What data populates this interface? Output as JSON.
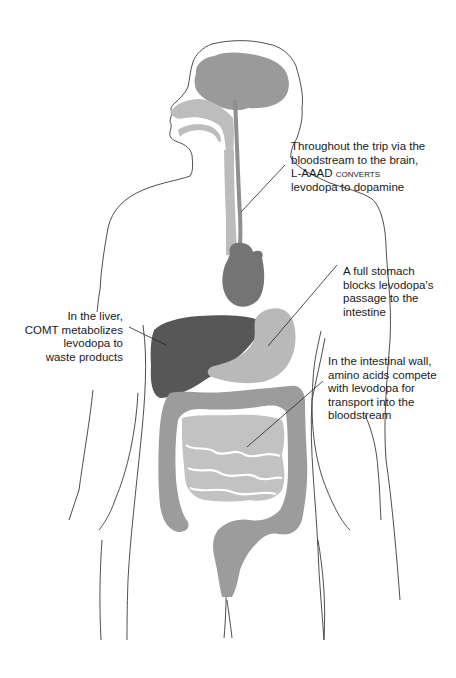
{
  "figure": {
    "colors": {
      "outline": "#3a3a3a",
      "brain": "#9a9a9a",
      "airway": "#bdbdbd",
      "vessel": "#8f8f8f",
      "esophagus": "#bcbcbc",
      "heart": "#747474",
      "liver": "#575757",
      "stomach": "#b9b9b9",
      "colon": "#9c9c9c",
      "small_intestine": "#c2c2c2",
      "leader": "#222222"
    }
  },
  "annotations": [
    {
      "id": "brain",
      "lines": [
        "Throughout the trip via the",
        "bloodstream to the brain,",
        "L-AAAD converts",
        "levodopa to dopamine"
      ]
    },
    {
      "id": "stomach",
      "lines": [
        "A full stomach",
        "blocks levodopa's",
        "passage to the",
        "intestine"
      ]
    },
    {
      "id": "liver",
      "lines": [
        "In the liver,",
        "COMT metabolizes",
        "levodopa to",
        "waste products"
      ]
    },
    {
      "id": "intestine",
      "lines": [
        "In the intestinal wall,",
        "amino acids compete",
        "with levodopa for",
        "transport into the",
        "bloodstream"
      ]
    }
  ]
}
